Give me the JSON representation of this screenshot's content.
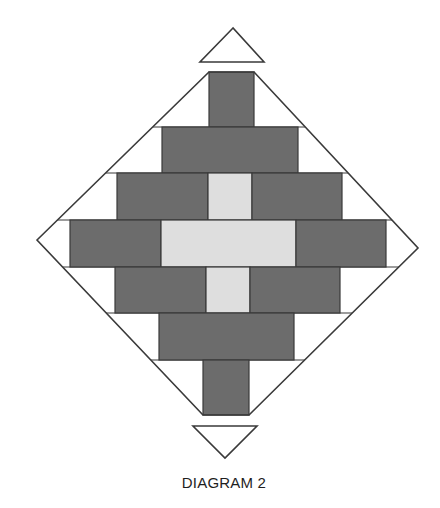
{
  "caption": "DIAGRAM 2",
  "colors": {
    "dark": "#6c6c6c",
    "light": "#dedede",
    "background": "#ffffff",
    "outline": "#3a3a3a"
  },
  "diagram": {
    "outline_polygon": [
      [
        37,
        240
      ],
      [
        209,
        72
      ],
      [
        254,
        72
      ],
      [
        418,
        248
      ],
      [
        249,
        415
      ],
      [
        203,
        415
      ]
    ],
    "top_arrow_triangle": [
      [
        233,
        28
      ],
      [
        200,
        62
      ],
      [
        264,
        62
      ]
    ],
    "bottom_arrow_triangle": [
      [
        193,
        426
      ],
      [
        257,
        426
      ],
      [
        225,
        458
      ]
    ],
    "rows": [
      {
        "y": 72,
        "h": 55,
        "cells": [
          {
            "x": 209,
            "w": 45,
            "fill": "dark"
          }
        ]
      },
      {
        "y": 127,
        "h": 46,
        "cells": [
          {
            "x": 162,
            "w": 136,
            "fill": "dark"
          }
        ]
      },
      {
        "y": 173,
        "h": 47,
        "cells": [
          {
            "x": 117,
            "w": 91,
            "fill": "dark"
          },
          {
            "x": 208,
            "w": 44,
            "fill": "light"
          },
          {
            "x": 252,
            "w": 90,
            "fill": "dark"
          }
        ]
      },
      {
        "y": 220,
        "h": 47,
        "cells": [
          {
            "x": 70,
            "w": 91,
            "fill": "dark"
          },
          {
            "x": 161,
            "w": 135,
            "fill": "light"
          },
          {
            "x": 296,
            "w": 90,
            "fill": "dark"
          }
        ]
      },
      {
        "y": 267,
        "h": 46,
        "cells": [
          {
            "x": 115,
            "w": 91,
            "fill": "dark"
          },
          {
            "x": 206,
            "w": 44,
            "fill": "light"
          },
          {
            "x": 250,
            "w": 90,
            "fill": "dark"
          }
        ]
      },
      {
        "y": 313,
        "h": 47,
        "cells": [
          {
            "x": 159,
            "w": 135,
            "fill": "dark"
          }
        ]
      },
      {
        "y": 360,
        "h": 55,
        "cells": [
          {
            "x": 203,
            "w": 46,
            "fill": "dark"
          }
        ]
      }
    ]
  }
}
